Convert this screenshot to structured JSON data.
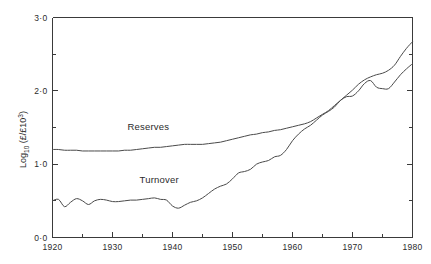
{
  "chart_data": {
    "type": "line",
    "title": "",
    "subtitle": "",
    "xlabel": "",
    "ylabel": "Log10 (£/£10^3)",
    "ylabel_parts": {
      "base": "Log",
      "base_sub": "10",
      "unit_open": " (£/£10",
      "unit_sup": "3",
      "unit_close": ")"
    },
    "xlim": [
      1920,
      1980
    ],
    "ylim": [
      0.0,
      3.0
    ],
    "grid": false,
    "legend_position": "inline-annotations",
    "x_major_ticks": [
      1920,
      1930,
      1940,
      1950,
      1960,
      1970,
      1980
    ],
    "x_major_tick_labels": [
      "1920",
      "1930",
      "1940",
      "1950",
      "1960",
      "1970",
      "1980"
    ],
    "x_minor_ticks": [
      1925,
      1935,
      1945,
      1955,
      1965,
      1975
    ],
    "y_major_ticks": [
      0.0,
      1.0,
      2.0,
      3.0
    ],
    "y_major_tick_labels": [
      "0·0",
      "1·0",
      "2·0",
      "3·0"
    ],
    "y_minor_ticks": [
      0.5,
      1.5,
      2.5
    ],
    "annotations": [
      {
        "text": "Reserves",
        "x": 1932.5,
        "y": 1.46
      },
      {
        "text": "Turnover",
        "x": 1934.5,
        "y": 0.75
      }
    ],
    "series": [
      {
        "name": "Reserves",
        "x": [
          1920,
          1921,
          1922,
          1923,
          1924,
          1925,
          1926,
          1927,
          1928,
          1929,
          1930,
          1931,
          1932,
          1933,
          1934,
          1935,
          1936,
          1937,
          1938,
          1939,
          1940,
          1941,
          1942,
          1943,
          1944,
          1945,
          1946,
          1947,
          1948,
          1949,
          1950,
          1951,
          1952,
          1953,
          1954,
          1955,
          1956,
          1957,
          1958,
          1959,
          1960,
          1961,
          1962,
          1963,
          1964,
          1965,
          1966,
          1967,
          1968,
          1969,
          1970,
          1971,
          1972,
          1973,
          1974,
          1975,
          1976,
          1977,
          1978,
          1979,
          1980
        ],
        "values": [
          1.2,
          1.2,
          1.19,
          1.19,
          1.19,
          1.18,
          1.18,
          1.18,
          1.18,
          1.18,
          1.18,
          1.18,
          1.19,
          1.19,
          1.2,
          1.21,
          1.22,
          1.23,
          1.23,
          1.24,
          1.25,
          1.26,
          1.27,
          1.27,
          1.27,
          1.27,
          1.28,
          1.29,
          1.3,
          1.32,
          1.34,
          1.36,
          1.38,
          1.4,
          1.41,
          1.43,
          1.44,
          1.46,
          1.47,
          1.49,
          1.51,
          1.53,
          1.55,
          1.58,
          1.63,
          1.68,
          1.73,
          1.8,
          1.87,
          1.94,
          2.01,
          2.09,
          2.15,
          2.19,
          2.22,
          2.24,
          2.28,
          2.35,
          2.47,
          2.58,
          2.67
        ]
      },
      {
        "name": "Turnover",
        "x": [
          1920,
          1921,
          1922,
          1923,
          1924,
          1925,
          1926,
          1927,
          1928,
          1929,
          1930,
          1931,
          1932,
          1933,
          1934,
          1935,
          1936,
          1937,
          1938,
          1939,
          1940,
          1941,
          1942,
          1943,
          1944,
          1945,
          1946,
          1947,
          1948,
          1949,
          1950,
          1951,
          1952,
          1953,
          1954,
          1955,
          1956,
          1957,
          1958,
          1959,
          1960,
          1961,
          1962,
          1963,
          1964,
          1965,
          1966,
          1967,
          1968,
          1969,
          1970,
          1971,
          1972,
          1973,
          1974,
          1975,
          1976,
          1977,
          1978,
          1979,
          1980
        ],
        "values": [
          0.5,
          0.52,
          0.42,
          0.48,
          0.53,
          0.5,
          0.45,
          0.5,
          0.52,
          0.51,
          0.49,
          0.49,
          0.5,
          0.51,
          0.51,
          0.52,
          0.53,
          0.54,
          0.52,
          0.51,
          0.43,
          0.4,
          0.44,
          0.48,
          0.5,
          0.54,
          0.6,
          0.66,
          0.7,
          0.73,
          0.8,
          0.88,
          0.9,
          0.93,
          1.0,
          1.03,
          1.05,
          1.1,
          1.12,
          1.2,
          1.32,
          1.41,
          1.48,
          1.53,
          1.6,
          1.67,
          1.72,
          1.78,
          1.87,
          1.92,
          1.93,
          2.0,
          2.1,
          2.14,
          2.05,
          2.03,
          2.03,
          2.12,
          2.22,
          2.3,
          2.37
        ]
      }
    ]
  }
}
